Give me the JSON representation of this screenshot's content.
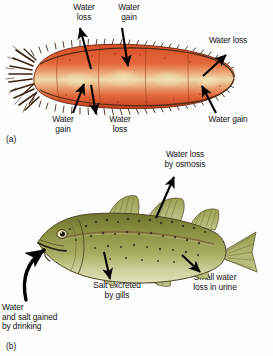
{
  "figure": {
    "background_color": "#fdfdfd",
    "text_color": "#141414",
    "panels": [
      {
        "id": "(a)",
        "organism": "sea-cucumber",
        "organism_colors": {
          "body_light": "#f0b27a",
          "body_mid": "#e2663a",
          "body_deep": "#c0391c",
          "pale_patch": "#efd9a8",
          "bristle": "#3b2410"
        },
        "labels": [
          {
            "name": "water-loss-top-left",
            "text": "Water\nloss"
          },
          {
            "name": "water-gain-top",
            "text": "Water\ngain"
          },
          {
            "name": "water-loss-top-right",
            "text": "Water loss"
          },
          {
            "name": "water-gain-bottom-left",
            "text": "Water\ngain"
          },
          {
            "name": "water-loss-bottom",
            "text": "Water\nloss"
          },
          {
            "name": "water-gain-bottom-right",
            "text": "Water gain"
          }
        ]
      },
      {
        "id": "(b)",
        "organism": "marine-bony-fish",
        "organism_colors": {
          "body_dorsal": "#7d7f37",
          "body_mid": "#9aa04e",
          "body_belly": "#cfd39a",
          "fin": "#a8ad62",
          "spot": "#2e2a14",
          "outline": "#4a4423"
        },
        "labels": [
          {
            "name": "water-loss-by-osmosis",
            "text": "Water loss\nby osmosis"
          },
          {
            "name": "salt-excreted-by-gills",
            "text": "Salt excreted\nby gills"
          },
          {
            "name": "small-water-loss-in-urine",
            "text": "Small water\nloss in urine"
          },
          {
            "name": "water-and-salt-gained-by-drinking",
            "text": "Water\nand salt gained\nby drinking"
          }
        ]
      }
    ]
  }
}
